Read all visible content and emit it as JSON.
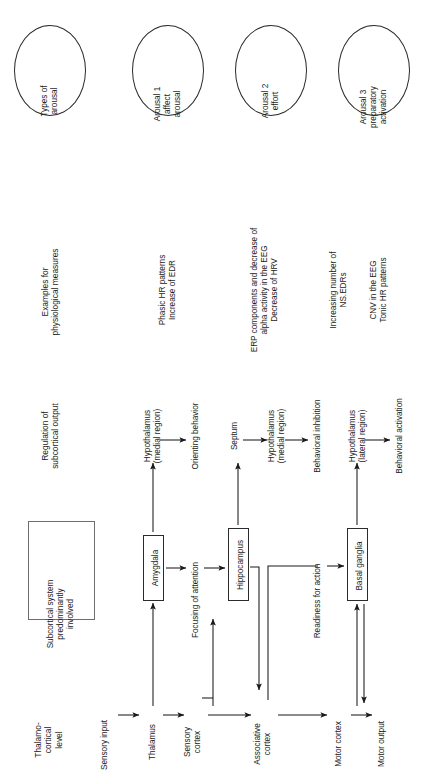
{
  "figure": {
    "orientation": "rotated-90-ccw",
    "background": "#ffffff",
    "stroke_color": "#2b2b2b"
  },
  "row_headers": {
    "types_of_arousal": "Types of\narousal",
    "examples": "Examples for\nphysiological measures",
    "regulation": "Regulation of\nsubcortical output",
    "subcortical": "Subcortical system\npredominantly\ninvolved",
    "thalamo": "Thalamo-\ncortical\nlevel"
  },
  "arousal_types": [
    {
      "id": "types",
      "label": "Types of\narousal",
      "is_header": true
    },
    {
      "id": "arousal1",
      "label": "Arousal 1\naffect\narousal",
      "is_header": false
    },
    {
      "id": "arousal2",
      "label": "Arousal 2\neffort",
      "is_header": false
    },
    {
      "id": "arousal3",
      "label": "Arousal 3\npreparatory\nactivation",
      "is_header": false
    }
  ],
  "physiological_measures": [
    {
      "id": "measures-header",
      "label": "Examples for\nphysiological measures"
    },
    {
      "id": "measures-1",
      "label": "Phasic HR patterns\nIncrease of EDR"
    },
    {
      "id": "measures-2",
      "label": "ERP components and decrease of\nalpha activity in the EEG\nDecrease of HRV"
    },
    {
      "id": "measures-3",
      "label": "Increasing number of\nNS.EDRs"
    },
    {
      "id": "measures-4",
      "label": "CNV in the EEG\nTonic HR patterns"
    }
  ],
  "regulation_row": {
    "header": "Regulation of\nsubcortical output",
    "nodes": [
      {
        "id": "hypothalamus-medial-1",
        "label": "Hypothalamus\n(medial region)"
      },
      {
        "id": "orienting-behavior",
        "label": "Orienting behavior"
      },
      {
        "id": "septum",
        "label": "Septum"
      },
      {
        "id": "hypothalamus-medial-2",
        "label": "Hypothalamus\n(medial region)"
      },
      {
        "id": "behavioral-inhibition",
        "label": "Behavioral inhibition"
      },
      {
        "id": "hypothalamus-lateral",
        "label": "Hypothalamus\n(lateral region)"
      },
      {
        "id": "behavioral-activation",
        "label": "Behavioral activation"
      }
    ]
  },
  "subcortical_row": {
    "header": "Subcortical system\npredominantly\ninvolved",
    "boxes": [
      {
        "id": "amygdala",
        "label": "Amygdala"
      },
      {
        "id": "hippocampus",
        "label": "Hippocampus"
      },
      {
        "id": "basal-ganglia",
        "label": "Basal ganglia"
      }
    ],
    "link_labels": [
      {
        "id": "focusing-of-attention",
        "label": "Focusing of attention"
      },
      {
        "id": "readiness-for-action",
        "label": "Readiness for action"
      }
    ]
  },
  "thalamo_row": {
    "header": "Thalamo-\ncortical\nlevel",
    "nodes": [
      {
        "id": "sensory-input",
        "label": "Sensory input"
      },
      {
        "id": "thalamus",
        "label": "Thalamus"
      },
      {
        "id": "sensory-cortex",
        "label": "Sensory\ncortex"
      },
      {
        "id": "associative-cortex",
        "label": "Associative\ncortex"
      },
      {
        "id": "motor-cortex",
        "label": "Motor cortex"
      },
      {
        "id": "motor-output",
        "label": "Motor output"
      }
    ]
  }
}
